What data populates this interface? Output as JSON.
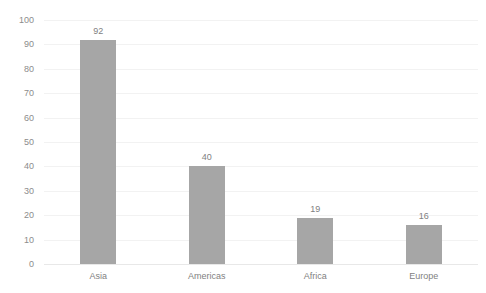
{
  "chart_data": {
    "type": "bar",
    "title": "",
    "subtitle": "",
    "xlabel": "",
    "ylabel": "",
    "categories": [
      "Asia",
      "Americas",
      "Africa",
      "Europe"
    ],
    "values": [
      92,
      40,
      19,
      16
    ],
    "value_labels": [
      "92",
      "40",
      "19",
      "16"
    ],
    "ylim": [
      0,
      100
    ],
    "yticks": [
      0,
      10,
      20,
      30,
      40,
      50,
      60,
      70,
      80,
      90,
      100
    ],
    "ytick_labels": [
      "0",
      "10",
      "20",
      "30",
      "40",
      "50",
      "60",
      "70",
      "80",
      "90",
      "100"
    ],
    "grid": true,
    "grid_axis": "y",
    "legend": false,
    "legend_position": "none",
    "bar_color": "#a6a6a6",
    "gridline_color": "#f2f2f2",
    "axis_color": "#e8e8e8",
    "label_color": "#7f7f7f",
    "tick_color": "#8c8c8c",
    "background_color": "#ffffff"
  }
}
